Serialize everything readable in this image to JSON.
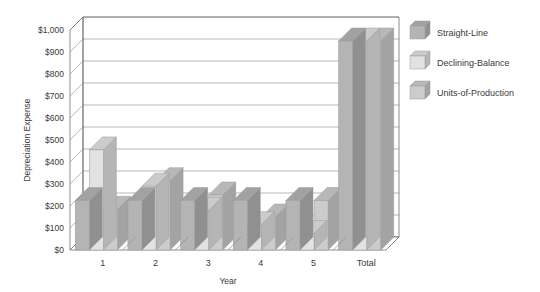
{
  "chart_data": {
    "type": "bar",
    "title": "",
    "xlabel": "Year",
    "ylabel": "Depreciation Expense",
    "categories": [
      "1",
      "2",
      "3",
      "4",
      "5",
      "Total"
    ],
    "series": [
      {
        "name": "Straight-Line",
        "values": [
          225,
          225,
          225,
          225,
          225,
          950
        ],
        "color": "#b4b4b4"
      },
      {
        "name": "Declining-Balance",
        "values": [
          455,
          290,
          180,
          115,
          75,
          950
        ],
        "color": "#e2e2e2"
      },
      {
        "name": "Units-of-Production",
        "values": [
          185,
          315,
          250,
          150,
          225,
          950
        ],
        "color": "#cccccc"
      }
    ],
    "ylim": [
      0,
      1000
    ],
    "ytick_values": [
      0,
      100,
      200,
      300,
      400,
      500,
      600,
      700,
      800,
      900,
      1000
    ],
    "ytick_labels": [
      "$0",
      "$100",
      "$200",
      "$300",
      "$400",
      "$500",
      "$600",
      "$700",
      "$800",
      "$900",
      "$1,000"
    ],
    "grid": true,
    "legend_position": "right",
    "style": "3d-column",
    "background": "#ffffff",
    "axis_color": "#6e6e6e",
    "grid_color": "#9a9a9a",
    "text_color": "#3a3a3a"
  },
  "legend": {
    "entries": [
      {
        "label": "Straight-Line"
      },
      {
        "label": "Declining-Balance"
      },
      {
        "label": "Units-of-Production"
      }
    ]
  }
}
